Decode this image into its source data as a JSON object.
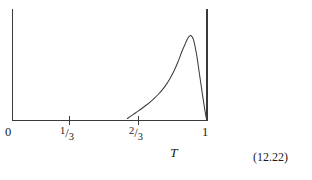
{
  "figure": {
    "equation_number": "(12.22)",
    "axis_label_x": "T",
    "x_tick_labels": [
      {
        "text": "0",
        "kind": "plain",
        "numerator": "",
        "denominator": "",
        "value": 0
      },
      {
        "text": "1/3",
        "kind": "fraction",
        "numerator": "1",
        "slash": "/",
        "denominator": "3",
        "value": 0.3333
      },
      {
        "text": "2/3",
        "kind": "fraction",
        "numerator": "2",
        "slash": "/",
        "denominator": "3",
        "value": 0.6667
      },
      {
        "text": "1",
        "kind": "plain",
        "numerator": "",
        "denominator": "",
        "value": 1
      }
    ],
    "line_color": "#3a3a3a",
    "curve_color": "#3c3c3c",
    "background_color": "#ffffff"
  },
  "chart_data": {
    "type": "line",
    "title": "",
    "subtitle": "",
    "xlabel": "T",
    "ylabel": "",
    "xlim": [
      0,
      1.0
    ],
    "ylim": [
      0,
      1.0
    ],
    "grid": false,
    "legend": null,
    "xticks": [
      0,
      0.3333,
      0.6667,
      1
    ],
    "xticklabels": [
      "0",
      "1/3",
      "2/3",
      "1"
    ],
    "yticks": [],
    "yticklabels": [],
    "annotations": [
      {
        "text": "(12.22)",
        "role": "equation-number"
      }
    ],
    "series": [
      {
        "name": "curve",
        "x": [
          0.59,
          0.61,
          0.63,
          0.65,
          0.67,
          0.69,
          0.71,
          0.73,
          0.75,
          0.77,
          0.79,
          0.81,
          0.83,
          0.85,
          0.87,
          0.885,
          0.9,
          0.915,
          0.93,
          0.945,
          0.955,
          0.965,
          0.975,
          0.985,
          0.995,
          1.0
        ],
        "y": [
          0.02,
          0.048,
          0.075,
          0.103,
          0.132,
          0.163,
          0.196,
          0.232,
          0.272,
          0.318,
          0.372,
          0.436,
          0.512,
          0.603,
          0.71,
          0.78,
          0.848,
          0.88,
          0.84,
          0.7,
          0.57,
          0.43,
          0.292,
          0.16,
          0.04,
          0.0
        ]
      }
    ]
  }
}
